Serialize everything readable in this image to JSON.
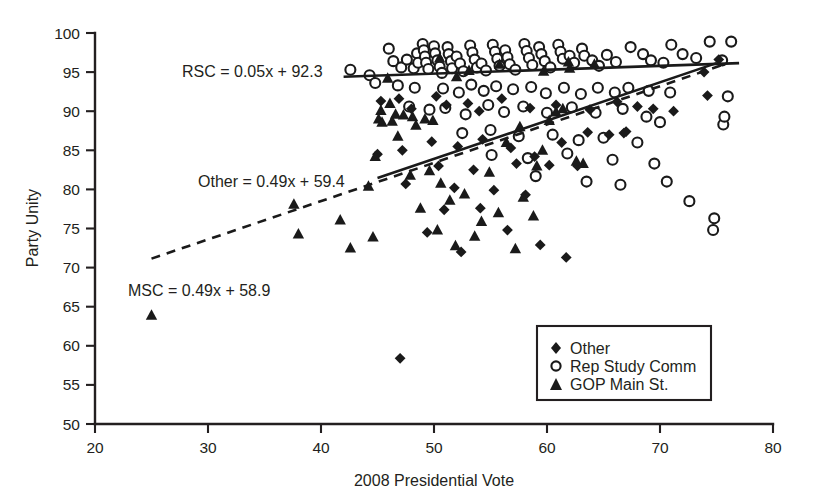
{
  "chart_data": {
    "type": "scatter",
    "title": "",
    "xlabel": "2008 Presidential Vote",
    "ylabel": "Party Unity",
    "xlim": [
      20,
      80
    ],
    "ylim": [
      50,
      100
    ],
    "xticks": [
      20,
      30,
      40,
      50,
      60,
      70,
      80
    ],
    "yticks": [
      50,
      55,
      60,
      65,
      70,
      75,
      80,
      85,
      90,
      95,
      100
    ],
    "grid": false,
    "legend_position": "lower-right",
    "legend": [
      {
        "label": "Other",
        "marker": "diamond",
        "filled": true
      },
      {
        "label": "Rep Study Comm",
        "marker": "circle",
        "filled": false
      },
      {
        "label": "GOP Main St.",
        "marker": "triangle",
        "filled": true
      }
    ],
    "annotations": [
      {
        "text": "RSC = 0.05x + 92.3",
        "x_px": 182,
        "y_px": 77
      },
      {
        "text": "Other = 0.49x + 59.4",
        "x_px": 198,
        "y_px": 187
      },
      {
        "text": "MSC = 0.49x + 58.9",
        "x_px": 128,
        "y_px": 296
      }
    ],
    "trendlines": [
      {
        "name": "RSC",
        "style": "solid",
        "slope": 0.05,
        "intercept": 92.3,
        "x_start": 42.0,
        "x_end": 77.0
      },
      {
        "name": "Other",
        "style": "solid",
        "slope": 0.49,
        "intercept": 59.4,
        "x_start": 45.0,
        "x_end": 75.0
      },
      {
        "name": "MSC",
        "style": "dashed",
        "slope": 0.49,
        "intercept": 58.9,
        "x_start": 25.0,
        "x_end": 76.0
      }
    ],
    "series": [
      {
        "name": "Rep Study Comm",
        "marker": "circle",
        "points": [
          [
            42.6,
            95.3
          ],
          [
            44.3,
            94.6
          ],
          [
            46.0,
            98.0
          ],
          [
            46.4,
            96.4
          ],
          [
            47.1,
            95.6
          ],
          [
            47.6,
            96.6
          ],
          [
            48.2,
            95.5
          ],
          [
            48.5,
            97.4
          ],
          [
            48.6,
            96.2
          ],
          [
            49.0,
            98.6
          ],
          [
            49.1,
            97.8
          ],
          [
            49.2,
            97.0
          ],
          [
            49.3,
            96.2
          ],
          [
            49.5,
            95.4
          ],
          [
            50.0,
            98.3
          ],
          [
            50.1,
            97.4
          ],
          [
            50.3,
            96.5
          ],
          [
            50.5,
            95.7
          ],
          [
            50.7,
            94.9
          ],
          [
            51.2,
            98.2
          ],
          [
            51.3,
            97.3
          ],
          [
            51.5,
            96.4
          ],
          [
            51.6,
            95.5
          ],
          [
            52.0,
            97.0
          ],
          [
            52.3,
            96.1
          ],
          [
            52.6,
            95.1
          ],
          [
            53.2,
            98.4
          ],
          [
            53.4,
            97.5
          ],
          [
            53.6,
            96.6
          ],
          [
            53.8,
            95.6
          ],
          [
            54.2,
            96.1
          ],
          [
            54.6,
            95.2
          ],
          [
            55.2,
            98.5
          ],
          [
            55.4,
            97.6
          ],
          [
            55.6,
            96.7
          ],
          [
            55.8,
            95.8
          ],
          [
            56.3,
            97.8
          ],
          [
            56.5,
            96.9
          ],
          [
            56.7,
            96.0
          ],
          [
            57.2,
            95.3
          ],
          [
            58.0,
            98.6
          ],
          [
            58.2,
            97.7
          ],
          [
            58.4,
            96.8
          ],
          [
            58.7,
            95.9
          ],
          [
            59.3,
            98.2
          ],
          [
            59.5,
            97.3
          ],
          [
            59.8,
            96.4
          ],
          [
            60.3,
            95.6
          ],
          [
            61.0,
            98.5
          ],
          [
            61.2,
            97.6
          ],
          [
            61.4,
            96.7
          ],
          [
            62.0,
            97.1
          ],
          [
            62.4,
            96.2
          ],
          [
            63.1,
            98.0
          ],
          [
            63.3,
            97.1
          ],
          [
            64.0,
            96.5
          ],
          [
            64.6,
            95.8
          ],
          [
            65.3,
            97.2
          ],
          [
            66.1,
            96.3
          ],
          [
            67.4,
            98.2
          ],
          [
            68.5,
            97.3
          ],
          [
            69.2,
            96.5
          ],
          [
            70.3,
            96.2
          ],
          [
            71.0,
            98.5
          ],
          [
            72.0,
            97.3
          ],
          [
            73.2,
            96.8
          ],
          [
            74.4,
            98.9
          ],
          [
            75.5,
            96.5
          ],
          [
            76.3,
            98.9
          ],
          [
            76.0,
            91.9
          ],
          [
            75.6,
            88.3
          ],
          [
            75.7,
            89.3
          ],
          [
            44.8,
            93.6
          ],
          [
            46.8,
            93.3
          ],
          [
            48.3,
            93.0
          ],
          [
            50.8,
            92.9
          ],
          [
            52.2,
            92.4
          ],
          [
            53.3,
            93.4
          ],
          [
            54.4,
            92.6
          ],
          [
            55.5,
            93.2
          ],
          [
            57.0,
            92.8
          ],
          [
            58.6,
            93.1
          ],
          [
            59.9,
            92.3
          ],
          [
            61.5,
            93.0
          ],
          [
            63.0,
            92.2
          ],
          [
            64.5,
            93.0
          ],
          [
            66.0,
            92.4
          ],
          [
            67.2,
            93.0
          ],
          [
            69.0,
            92.6
          ],
          [
            70.9,
            92.4
          ],
          [
            47.8,
            90.6
          ],
          [
            49.6,
            90.2
          ],
          [
            51.0,
            90.4
          ],
          [
            52.8,
            89.6
          ],
          [
            54.8,
            90.8
          ],
          [
            56.2,
            89.9
          ],
          [
            57.9,
            90.6
          ],
          [
            60.0,
            89.8
          ],
          [
            62.2,
            90.5
          ],
          [
            64.3,
            89.8
          ],
          [
            66.7,
            90.3
          ],
          [
            68.8,
            89.3
          ],
          [
            70.0,
            88.6
          ],
          [
            52.5,
            87.2
          ],
          [
            55.0,
            87.6
          ],
          [
            57.5,
            86.8
          ],
          [
            60.5,
            87.0
          ],
          [
            62.8,
            86.3
          ],
          [
            65.0,
            86.6
          ],
          [
            68.0,
            86.0
          ],
          [
            55.1,
            84.4
          ],
          [
            58.3,
            84.0
          ],
          [
            61.8,
            84.6
          ],
          [
            65.8,
            83.8
          ],
          [
            69.5,
            83.3
          ],
          [
            59.0,
            81.7
          ],
          [
            63.5,
            81.0
          ],
          [
            66.5,
            80.6
          ],
          [
            70.6,
            81.0
          ],
          [
            72.6,
            78.5
          ],
          [
            74.8,
            76.3
          ],
          [
            74.7,
            74.8
          ]
        ]
      },
      {
        "name": "Other",
        "marker": "diamond",
        "points": [
          [
            45.3,
            91.3
          ],
          [
            46.9,
            91.6
          ],
          [
            48.0,
            90.3
          ],
          [
            50.2,
            91.9
          ],
          [
            51.1,
            90.8
          ],
          [
            53.0,
            91.0
          ],
          [
            54.0,
            90.0
          ],
          [
            56.0,
            91.6
          ],
          [
            58.5,
            90.4
          ],
          [
            60.8,
            90.8
          ],
          [
            63.8,
            90.2
          ],
          [
            66.2,
            91.2
          ],
          [
            68.0,
            90.6
          ],
          [
            69.4,
            90.3
          ],
          [
            74.2,
            92.0
          ],
          [
            75.2,
            96.6
          ],
          [
            45.0,
            84.5
          ],
          [
            47.2,
            85.0
          ],
          [
            49.8,
            86.1
          ],
          [
            52.1,
            85.5
          ],
          [
            54.3,
            86.4
          ],
          [
            56.8,
            85.3
          ],
          [
            58.9,
            84.2
          ],
          [
            61.3,
            86.0
          ],
          [
            63.6,
            87.3
          ],
          [
            65.5,
            87.0
          ],
          [
            67.0,
            87.4
          ],
          [
            50.4,
            83.0
          ],
          [
            53.5,
            82.5
          ],
          [
            57.3,
            83.3
          ],
          [
            60.2,
            83.1
          ],
          [
            62.7,
            83.0
          ],
          [
            66.8,
            87.2
          ],
          [
            47.5,
            80.7
          ],
          [
            51.8,
            80.2
          ],
          [
            55.3,
            79.9
          ],
          [
            58.1,
            79.3
          ],
          [
            50.9,
            77.4
          ],
          [
            54.1,
            77.6
          ],
          [
            49.4,
            74.5
          ],
          [
            52.4,
            72.0
          ],
          [
            56.5,
            74.8
          ],
          [
            59.4,
            72.9
          ],
          [
            61.7,
            71.3
          ],
          [
            47.0,
            58.4
          ],
          [
            73.9,
            95.0
          ],
          [
            71.2,
            90.0
          ]
        ]
      },
      {
        "name": "GOP Main St.",
        "marker": "triangle",
        "points": [
          [
            25.0,
            63.9
          ],
          [
            37.6,
            78.1
          ],
          [
            38.0,
            74.3
          ],
          [
            41.7,
            76.1
          ],
          [
            42.6,
            72.5
          ],
          [
            44.6,
            73.9
          ],
          [
            44.2,
            80.4
          ],
          [
            44.8,
            84.2
          ],
          [
            45.1,
            89.0
          ],
          [
            45.3,
            90.1
          ],
          [
            45.4,
            88.6
          ],
          [
            46.3,
            88.7
          ],
          [
            46.1,
            91.0
          ],
          [
            46.6,
            89.6
          ],
          [
            47.3,
            89.5
          ],
          [
            46.8,
            86.8
          ],
          [
            48.1,
            89.3
          ],
          [
            48.4,
            88.2
          ],
          [
            49.2,
            89.0
          ],
          [
            49.9,
            88.8
          ],
          [
            47.9,
            81.8
          ],
          [
            49.6,
            82.4
          ],
          [
            50.6,
            80.8
          ],
          [
            48.8,
            77.6
          ],
          [
            51.4,
            78.6
          ],
          [
            52.7,
            79.4
          ],
          [
            50.3,
            74.8
          ],
          [
            51.9,
            72.8
          ],
          [
            53.6,
            74.0
          ],
          [
            54.2,
            75.9
          ],
          [
            54.9,
            82.2
          ],
          [
            55.7,
            77.0
          ],
          [
            57.2,
            72.4
          ],
          [
            57.9,
            79.0
          ],
          [
            58.8,
            76.6
          ],
          [
            59.6,
            85.0
          ],
          [
            60.2,
            88.8
          ],
          [
            60.8,
            89.9
          ],
          [
            61.4,
            90.3
          ],
          [
            62.6,
            83.6
          ],
          [
            63.2,
            83.3
          ],
          [
            59.1,
            83.0
          ],
          [
            56.4,
            86.0
          ],
          [
            57.6,
            88.0
          ],
          [
            62.0,
            95.5
          ],
          [
            61.9,
            96.3
          ],
          [
            52.0,
            94.4
          ],
          [
            53.1,
            95.2
          ],
          [
            59.7,
            95.1
          ],
          [
            55.8,
            96.0
          ],
          [
            45.9,
            94.2
          ],
          [
            50.5,
            96.8
          ],
          [
            64.2,
            96.0
          ]
        ]
      }
    ]
  },
  "axis": {
    "x_title": "2008 Presidential Vote",
    "y_title": "Party Unity",
    "x_tick_labels": [
      "20",
      "30",
      "40",
      "50",
      "60",
      "70",
      "80"
    ],
    "y_tick_labels": [
      "50",
      "55",
      "60",
      "65",
      "70",
      "75",
      "80",
      "85",
      "90",
      "95",
      "100"
    ]
  },
  "equations": {
    "rsc": "RSC = 0.05x + 92.3",
    "other": "Other = 0.49x + 59.4",
    "msc": "MSC = 0.49x + 58.9"
  },
  "legend": {
    "other": "Other",
    "rsc": "Rep Study Comm",
    "msc": "GOP Main St."
  },
  "colors": {
    "ink": "#231f20",
    "marker": "#1a1a1a",
    "background": "#ffffff"
  }
}
